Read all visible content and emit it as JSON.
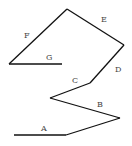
{
  "diagram": {
    "type": "labeled-polyline-path",
    "stroke_color": "#111111",
    "label_color": "#444444",
    "segments": [
      {
        "label": "A",
        "x1": 14,
        "y1": 135,
        "x2": 66,
        "y2": 135,
        "lx": 42,
        "ly": 130
      },
      {
        "label": "B",
        "x1": 66,
        "y1": 135,
        "x2": 120,
        "y2": 118,
        "lx": 97,
        "ly": 107
      },
      {
        "label": "B",
        "x1": 120,
        "y1": 118,
        "x2": 50,
        "y2": 98,
        "lx": 97,
        "ly": 107
      },
      {
        "label": "C",
        "x1": 50,
        "y1": 98,
        "x2": 90,
        "y2": 83,
        "lx": 72,
        "ly": 82
      },
      {
        "label": "D",
        "x1": 90,
        "y1": 83,
        "x2": 124,
        "y2": 45,
        "lx": 115,
        "ly": 72
      },
      {
        "label": "E",
        "x1": 124,
        "y1": 45,
        "x2": 67,
        "y2": 9,
        "lx": 101,
        "ly": 21
      },
      {
        "label": "F",
        "x1": 67,
        "y1": 9,
        "x2": 9,
        "y2": 64,
        "lx": 24,
        "ly": 37
      },
      {
        "label": "G",
        "x1": 9,
        "y1": 64,
        "x2": 62,
        "y2": 64,
        "lx": 47,
        "ly": 59
      }
    ],
    "labels": [
      {
        "text": "A",
        "x": 41,
        "y": 131
      },
      {
        "text": "B",
        "x": 97,
        "y": 107
      },
      {
        "text": "C",
        "x": 72,
        "y": 83
      },
      {
        "text": "D",
        "x": 115,
        "y": 72
      },
      {
        "text": "E",
        "x": 101,
        "y": 22
      },
      {
        "text": "F",
        "x": 24,
        "y": 38
      },
      {
        "text": "G",
        "x": 46,
        "y": 60
      }
    ]
  }
}
